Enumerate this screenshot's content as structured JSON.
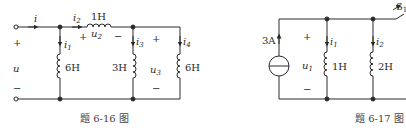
{
  "figures": [
    {
      "id": "fig-6-16",
      "caption": "题 6-16 图",
      "labels": {
        "i": "i",
        "i1": "i",
        "i1_sub": "1",
        "i2": "i",
        "i2_sub": "2",
        "i3": "i",
        "i3_sub": "3",
        "i4": "i",
        "i4_sub": "4",
        "u": "u",
        "u2": "u",
        "u2_sub": "2",
        "u3": "u",
        "u3_sub": "3",
        "plus": "+",
        "minus": "−",
        "L_series": "1H",
        "L1": "6H",
        "L3": "3H",
        "L4": "6H"
      }
    },
    {
      "id": "fig-6-17",
      "caption": "题 6-17 图",
      "labels": {
        "source": "3A",
        "u1": "u",
        "u1_sub": "1",
        "i1": "i",
        "i1_sub": "1",
        "i2": "i",
        "i2_sub": "2",
        "L1": "1H",
        "L2": "2H",
        "switch": "S",
        "switch_sub": "1",
        "plus": "+",
        "minus": "−"
      }
    }
  ]
}
